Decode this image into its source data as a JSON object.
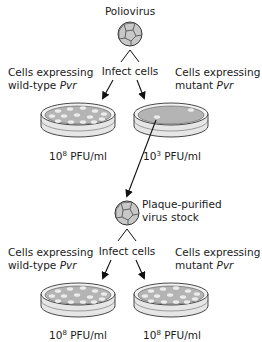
{
  "title": "Poliovirus",
  "step1": {
    "infect_label": "Infect cells",
    "left_label": {
      "line1": "Cells expressing",
      "line2_prefix": "wild-type ",
      "line2_gene": "Pvr"
    },
    "right_label": {
      "line1": "Cells expressing",
      "line2_prefix": "mutant ",
      "line2_gene": "Pvr"
    },
    "left_titer": {
      "base": "10",
      "exp": "8",
      "unit": " PFU/ml"
    },
    "right_titer": {
      "base": "10",
      "exp": "3",
      "unit": " PFU/ml"
    }
  },
  "purified": {
    "line1": "Plaque-purified",
    "line2": "virus stock"
  },
  "step2": {
    "infect_label": "Infect cells",
    "left_label": {
      "line1": "Cells expressing",
      "line2_prefix": "wild-type ",
      "line2_gene": "Pvr"
    },
    "right_label": {
      "line1": "Cells expressing",
      "line2_prefix": "mutant ",
      "line2_gene": "Pvr"
    },
    "left_titer": {
      "base": "10",
      "exp": "8",
      "unit": " PFU/ml"
    },
    "right_titer": {
      "base": "10",
      "exp": "8",
      "unit": " PFU/ml"
    }
  },
  "colors": {
    "virus_fill": "#c8c8c8",
    "dish_media": "#b4b4b4",
    "plaque": "#ececec",
    "stroke": "#333333"
  }
}
